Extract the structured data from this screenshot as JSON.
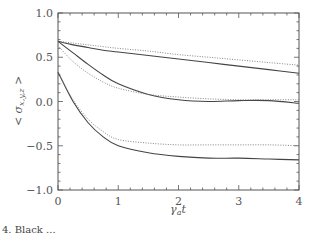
{
  "chart_data": {
    "type": "line",
    "title": "",
    "xlabel": "γ_a t",
    "ylabel": "<σ_x,y,z>",
    "xlim": [
      0,
      4
    ],
    "ylim": [
      -1.0,
      1.0
    ],
    "x_ticks": [
      "0",
      "1",
      "2",
      "3",
      "4"
    ],
    "y_ticks": [
      "1.0",
      "0.5",
      "0.0",
      "-0.5",
      "-1.0"
    ],
    "grid": false,
    "legend": null,
    "x": [
      0,
      0.25,
      0.5,
      0.75,
      1.0,
      1.5,
      2.0,
      2.5,
      3.0,
      3.5,
      4.0
    ],
    "series": [
      {
        "name": "solid-upper",
        "style": "solid",
        "values": [
          0.68,
          0.64,
          0.61,
          0.58,
          0.56,
          0.52,
          0.48,
          0.44,
          0.4,
          0.36,
          0.32
        ]
      },
      {
        "name": "dotted-upper",
        "style": "dotted",
        "values": [
          0.68,
          0.66,
          0.64,
          0.62,
          0.6,
          0.57,
          0.53,
          0.5,
          0.47,
          0.44,
          0.41
        ]
      },
      {
        "name": "solid-middle",
        "style": "solid",
        "values": [
          0.68,
          0.55,
          0.42,
          0.3,
          0.2,
          0.08,
          0.02,
          0.0,
          0.01,
          0.01,
          -0.02
        ]
      },
      {
        "name": "dotted-middle",
        "style": "dotted",
        "values": [
          0.63,
          0.45,
          0.32,
          0.22,
          0.15,
          0.08,
          0.05,
          0.03,
          0.02,
          0.02,
          0.02
        ]
      },
      {
        "name": "solid-lower",
        "style": "solid",
        "values": [
          0.33,
          0.0,
          -0.24,
          -0.4,
          -0.5,
          -0.58,
          -0.62,
          -0.64,
          -0.64,
          -0.65,
          -0.66
        ]
      },
      {
        "name": "dotted-lower",
        "style": "dotted",
        "values": [
          0.33,
          0.02,
          -0.2,
          -0.34,
          -0.43,
          -0.47,
          -0.49,
          -0.49,
          -0.49,
          -0.49,
          -0.5
        ]
      }
    ]
  },
  "axes": {
    "x_tick_labels": [
      "0",
      "1",
      "2",
      "3",
      "4"
    ],
    "y_tick_labels": [
      "1.0",
      "0.5",
      "0.0",
      "-0.5",
      "-1.0"
    ],
    "xlabel_main": "γ",
    "xlabel_sub": "a",
    "xlabel_tail": "t",
    "ylabel_main": "< σ",
    "ylabel_sub": "x,y,z",
    "ylabel_tail": " >"
  },
  "caption": "4.  Black ..."
}
